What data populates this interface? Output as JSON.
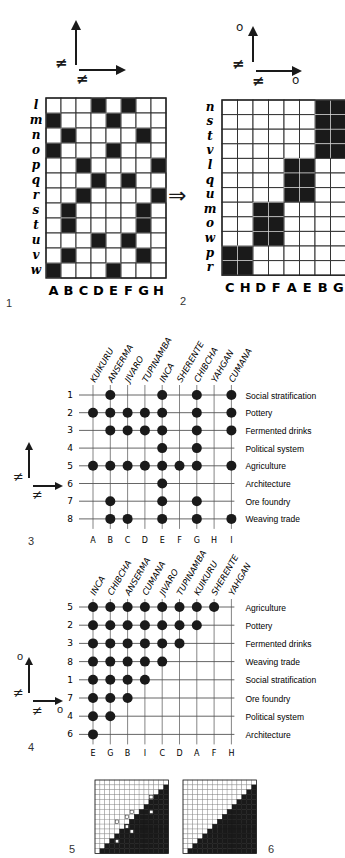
{
  "figure1": {
    "number": "1",
    "axes": {
      "vertical_sign": "≠",
      "horizontal_sign": "≠",
      "vertical_end": "",
      "horizontal_end": ""
    },
    "columns": [
      "A",
      "B",
      "C",
      "D",
      "E",
      "F",
      "G",
      "H"
    ],
    "rows": [
      "l",
      "m",
      "n",
      "o",
      "p",
      "q",
      "r",
      "s",
      "t",
      "u",
      "v",
      "w"
    ],
    "black_cells": {
      "l": [
        "D",
        "F"
      ],
      "m": [
        "A",
        "E"
      ],
      "n": [
        "B",
        "G"
      ],
      "o": [
        "A",
        "E"
      ],
      "p": [
        "C",
        "H"
      ],
      "q": [
        "D",
        "F"
      ],
      "r": [
        "C",
        "H"
      ],
      "s": [
        "B",
        "G"
      ],
      "t": [
        "B",
        "G"
      ],
      "u": [
        "D",
        "F"
      ],
      "v": [
        "B",
        "G"
      ],
      "w": [
        "A",
        "E"
      ]
    }
  },
  "transform_arrow": "⇒",
  "figure2": {
    "number": "2",
    "axes": {
      "vertical_sign": "≠",
      "horizontal_sign": "≠",
      "vertical_end": "o",
      "horizontal_end": "o"
    },
    "columns": [
      "C",
      "H",
      "D",
      "F",
      "A",
      "E",
      "B",
      "G"
    ],
    "rows": [
      "n",
      "s",
      "t",
      "v",
      "l",
      "q",
      "u",
      "m",
      "o",
      "w",
      "p",
      "r"
    ],
    "black_cells": {
      "n": [
        "B",
        "G"
      ],
      "s": [
        "B",
        "G"
      ],
      "t": [
        "B",
        "G"
      ],
      "v": [
        "B",
        "G"
      ],
      "l": [
        "A",
        "E"
      ],
      "q": [
        "A",
        "E"
      ],
      "u": [
        "A",
        "E"
      ],
      "m": [
        "D",
        "F"
      ],
      "o": [
        "D",
        "F"
      ],
      "w": [
        "D",
        "F"
      ],
      "p": [
        "C",
        "H"
      ],
      "r": [
        "C",
        "H"
      ]
    }
  },
  "figure3": {
    "number": "3",
    "axes": {
      "vertical_sign": "≠",
      "horizontal_sign": "≠",
      "vertical_end": "",
      "horizontal_end": ""
    },
    "columns": [
      {
        "code": "A",
        "name": "KUIKURU"
      },
      {
        "code": "B",
        "name": "ANSERMA"
      },
      {
        "code": "C",
        "name": "JIVARO"
      },
      {
        "code": "D",
        "name": "TUPINAMBA"
      },
      {
        "code": "E",
        "name": "INCA"
      },
      {
        "code": "F",
        "name": "SHERENTE"
      },
      {
        "code": "G",
        "name": "CHIBCHA"
      },
      {
        "code": "H",
        "name": "YAHGAN"
      },
      {
        "code": "I",
        "name": "CUMANA"
      }
    ],
    "rows": [
      {
        "num": "1",
        "label": "Social stratification",
        "dots": [
          "B",
          "E",
          "G",
          "I"
        ]
      },
      {
        "num": "2",
        "label": "Pottery",
        "dots": [
          "A",
          "B",
          "C",
          "D",
          "E",
          "G",
          "I"
        ]
      },
      {
        "num": "3",
        "label": "Fermented drinks",
        "dots": [
          "B",
          "C",
          "D",
          "E",
          "G",
          "I"
        ]
      },
      {
        "num": "4",
        "label": "Political system",
        "dots": [
          "E",
          "G"
        ]
      },
      {
        "num": "5",
        "label": "Agriculture",
        "dots": [
          "A",
          "B",
          "C",
          "D",
          "E",
          "F",
          "G",
          "I"
        ]
      },
      {
        "num": "6",
        "label": "Architecture",
        "dots": [
          "E"
        ]
      },
      {
        "num": "7",
        "label": "Ore foundry",
        "dots": [
          "B",
          "E",
          "G"
        ]
      },
      {
        "num": "8",
        "label": "Weaving trade",
        "dots": [
          "B",
          "C",
          "E",
          "G",
          "I"
        ]
      }
    ]
  },
  "figure4": {
    "number": "4",
    "axes": {
      "vertical_sign": "≠",
      "horizontal_sign": "≠",
      "vertical_end": "o",
      "horizontal_end": "o"
    },
    "columns": [
      {
        "code": "E",
        "name": "INCA"
      },
      {
        "code": "G",
        "name": "CHIBCHA"
      },
      {
        "code": "B",
        "name": "ANSERMA"
      },
      {
        "code": "I",
        "name": "CUMANA"
      },
      {
        "code": "C",
        "name": "JIVARO"
      },
      {
        "code": "D",
        "name": "TUPINAMBA"
      },
      {
        "code": "A",
        "name": "KUIKURU"
      },
      {
        "code": "F",
        "name": "SHERENTE"
      },
      {
        "code": "H",
        "name": "YAHGAN"
      }
    ],
    "rows": [
      {
        "num": "5",
        "label": "Agriculture",
        "count": 8
      },
      {
        "num": "2",
        "label": "Pottery",
        "count": 7
      },
      {
        "num": "3",
        "label": "Fermented drinks",
        "count": 6
      },
      {
        "num": "8",
        "label": "Weaving trade",
        "count": 5
      },
      {
        "num": "1",
        "label": "Social stratification",
        "count": 4
      },
      {
        "num": "7",
        "label": "Ore foundry",
        "count": 3
      },
      {
        "num": "4",
        "label": "Political system",
        "count": 2
      },
      {
        "num": "6",
        "label": "Architecture",
        "count": 1
      }
    ]
  },
  "figure5": {
    "number": "5",
    "size": 15,
    "description": "triangular matrix with marked cells"
  },
  "figure6": {
    "number": "6",
    "size": 15,
    "description": "triangular staircase matrix"
  },
  "colors": {
    "ink": "#1a1a1a",
    "grid": "#333333",
    "thin": "#555555",
    "paper": "#ffffff"
  }
}
